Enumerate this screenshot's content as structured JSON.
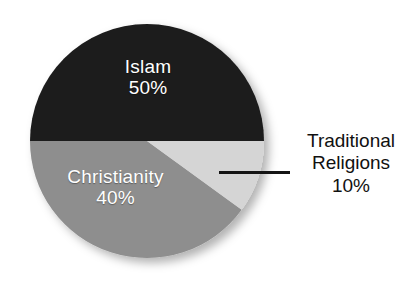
{
  "chart_data": {
    "type": "pie",
    "title": "",
    "subtitle": "",
    "xlabel": "",
    "ylabel": "",
    "legend_position": "none",
    "grid": false,
    "units": "percent",
    "total": 100,
    "start_angle_deg": 0,
    "direction": "clockwise",
    "categories": [
      "Islam",
      "Christianity",
      "Traditional Religions"
    ],
    "values": [
      50,
      40,
      10
    ],
    "slices": [
      {
        "label": "Islam",
        "value": 50,
        "value_text": "50%",
        "color": "#1c1c1c",
        "text_color": "#ffffff",
        "label_placement": "inside",
        "start_angle_deg": 180,
        "end_angle_deg": 360,
        "sweep_deg": 180
      },
      {
        "label": "Christianity",
        "value": 40,
        "value_text": "40%",
        "color": "#8e8e8e",
        "text_color": "#ffffff",
        "label_placement": "inside",
        "start_angle_deg": 36,
        "end_angle_deg": 180,
        "sweep_deg": 144
      },
      {
        "label": "Traditional Religions",
        "value": 10,
        "value_text": "10%",
        "color": "#d5d5d5",
        "text_color": "#111111",
        "label_placement": "outside",
        "start_angle_deg": 0,
        "end_angle_deg": 36,
        "sweep_deg": 36
      }
    ]
  },
  "chart": {
    "islam": {
      "name": "Islam",
      "percent": "50%"
    },
    "christianity": {
      "name": "Christianity",
      "percent": "40%"
    },
    "traditional": {
      "name_line1": "Traditional",
      "name_line2": "Religions",
      "percent": "10%"
    }
  },
  "colors": {
    "islam": "#1c1c1c",
    "christianity": "#8e8e8e",
    "traditional": "#d5d5d5",
    "background": "#ffffff",
    "leader_line": "#141414",
    "inside_label_text": "#ffffff",
    "outside_label_text": "#111111"
  }
}
